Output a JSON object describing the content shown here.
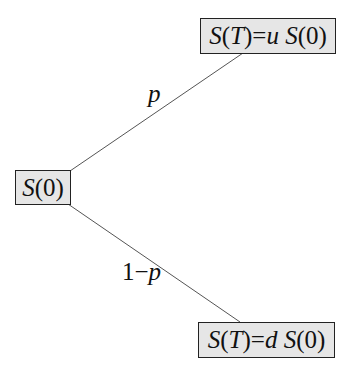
{
  "diagram": {
    "type": "binomial-tree",
    "nodes": {
      "root": {
        "S": "S",
        "arg": "(0)"
      },
      "up": {
        "lhs_S": "S",
        "lhs_arg": "(",
        "lhs_T": "T",
        "lhs_close": ")",
        "eq": "=",
        "factor": "u",
        "rhs_S": "S",
        "rhs_arg": "(0)"
      },
      "down": {
        "lhs_S": "S",
        "lhs_arg": "(",
        "lhs_T": "T",
        "lhs_close": ")",
        "eq": "=",
        "factor": "d",
        "rhs_S": "S",
        "rhs_arg": "(0)"
      }
    },
    "edges": {
      "up_prob": "p",
      "down_prob_prefix": "1−",
      "down_prob_var": "p"
    },
    "colors": {
      "node_fill": "#e6e6e6",
      "node_border": "#222222",
      "edge": "#555555"
    }
  }
}
